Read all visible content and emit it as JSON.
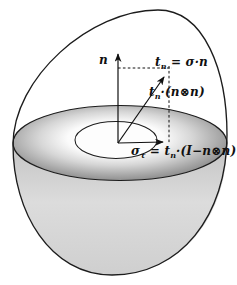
{
  "diagram": {
    "labels": {
      "normal_axis": "n",
      "traction": {
        "base": "t",
        "sub": "n",
        "rest": " = σ·n"
      },
      "normal_component": {
        "base": "t",
        "sub": "n",
        "rest": "·(n⊗n)"
      },
      "tangential": {
        "sigma": "σ",
        "sigma_sub": "τ",
        "eq": " = ",
        "base": "t",
        "sub": "n",
        "rest": "·(I−n⊗n)"
      }
    },
    "colors": {
      "stroke": "#1c1c1c",
      "disk_rim": "#8f8f8f",
      "disk_center": "#ffffff",
      "bowl_fill": "#d6d6d6",
      "hole_fill": "#fdfdfd",
      "background": "#ffffff"
    }
  }
}
